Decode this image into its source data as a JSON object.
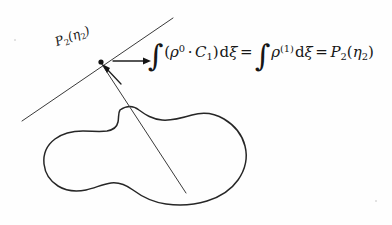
{
  "figure": {
    "background_color": "#fefefe",
    "ink_color": "#262626"
  },
  "labels": {
    "tangent_point": {
      "base": "P",
      "base_subscript": "2",
      "open_paren": "(",
      "eta": "η",
      "eta_subscript": "2",
      "close_paren": ")"
    }
  },
  "equation": {
    "lhs_integral": "∫",
    "lhs_open": "(",
    "rho": "ρ",
    "rho_superscript": "0",
    "dot": "·",
    "c_symbol": "C",
    "c_subscript": "1",
    "lhs_close": ")",
    "differential": "d",
    "xi": "ξ",
    "equals_1": "=",
    "rhs_integral": "∫",
    "rho_2": "ρ",
    "rho_2_superscript": "(1)",
    "differential_2": "d",
    "xi_2": "ξ",
    "equals_2": "=",
    "result_base": "P",
    "result_subscript": "2",
    "result_open": "(",
    "result_eta": "η",
    "result_eta_subscript": "2",
    "result_close": ")",
    "plain_text": "∫(ρ⁰·C₁)dξ = ∫ρ⁽¹⁾dξ = P₂(η₂)"
  },
  "geometry": {
    "tangent_point_xy": [
      101,
      62
    ],
    "tangent_line_from": [
      22,
      121
    ],
    "tangent_line_to": [
      173,
      18
    ],
    "chord_line_from": [
      101,
      63
    ],
    "chord_line_to": [
      186,
      193
    ],
    "horizontal_arrow_from": [
      113,
      61
    ],
    "horizontal_arrow_to": [
      150,
      61
    ],
    "pointer_arrow_from": [
      120,
      83
    ],
    "pointer_arrow_to": [
      104,
      66
    ]
  }
}
